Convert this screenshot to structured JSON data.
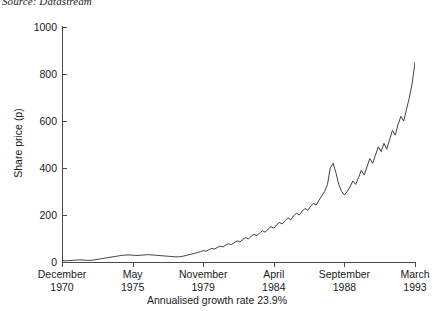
{
  "source_note": "Source: Datastream",
  "caption": "Annualised growth rate 23.9%",
  "chart_data": {
    "type": "line",
    "title": "",
    "subtitle": "",
    "source": "Source: Datastream",
    "annotation": "Annualised growth rate 23.9%",
    "xlabel": "",
    "ylabel": "Share price (p)",
    "ylim": [
      0,
      1000
    ],
    "yticks": [
      0,
      200,
      400,
      600,
      800,
      1000
    ],
    "ytick_labels": [
      "0",
      "200",
      "400",
      "600",
      "800",
      "1000"
    ],
    "grid": false,
    "legend": false,
    "legend_position": "none",
    "line_color": "#2b2b2b",
    "xtick_labels": [
      {
        "month": "December",
        "year": "1970"
      },
      {
        "month": "May",
        "year": "1975"
      },
      {
        "month": "November",
        "year": "1979"
      },
      {
        "month": "April",
        "year": "1984"
      },
      {
        "month": "September",
        "year": "1988"
      },
      {
        "month": "March",
        "year": "1993"
      }
    ],
    "xtick_positions_frac": [
      0.0,
      0.2,
      0.4,
      0.6,
      0.8,
      1.0
    ],
    "x_start": "December 1970",
    "x_end": "March 1993",
    "series": [
      {
        "name": "Share price (p)",
        "x_frac": [
          0.0,
          0.008,
          0.016,
          0.024,
          0.032,
          0.04,
          0.048,
          0.056,
          0.064,
          0.072,
          0.08,
          0.088,
          0.096,
          0.104,
          0.112,
          0.12,
          0.128,
          0.136,
          0.144,
          0.152,
          0.16,
          0.168,
          0.176,
          0.184,
          0.192,
          0.2,
          0.208,
          0.216,
          0.224,
          0.232,
          0.24,
          0.248,
          0.256,
          0.264,
          0.272,
          0.28,
          0.288,
          0.296,
          0.304,
          0.312,
          0.32,
          0.328,
          0.336,
          0.344,
          0.352,
          0.36,
          0.368,
          0.376,
          0.384,
          0.392,
          0.4,
          0.408,
          0.416,
          0.424,
          0.432,
          0.44,
          0.448,
          0.456,
          0.464,
          0.472,
          0.48,
          0.488,
          0.496,
          0.504,
          0.512,
          0.52,
          0.528,
          0.536,
          0.544,
          0.552,
          0.56,
          0.568,
          0.576,
          0.584,
          0.592,
          0.6,
          0.608,
          0.616,
          0.624,
          0.632,
          0.64,
          0.648,
          0.656,
          0.664,
          0.672,
          0.68,
          0.688,
          0.696,
          0.704,
          0.712,
          0.72,
          0.728,
          0.736,
          0.744,
          0.752,
          0.76,
          0.768,
          0.776,
          0.784,
          0.792,
          0.8,
          0.808,
          0.816,
          0.824,
          0.832,
          0.84,
          0.848,
          0.856,
          0.864,
          0.872,
          0.88,
          0.888,
          0.896,
          0.904,
          0.912,
          0.92,
          0.928,
          0.936,
          0.944,
          0.952,
          0.96,
          0.968,
          0.976,
          0.984,
          0.992,
          1.0
        ],
        "values": [
          5,
          5,
          6,
          6,
          7,
          8,
          9,
          9,
          8,
          7,
          7,
          8,
          10,
          12,
          14,
          16,
          18,
          20,
          22,
          24,
          26,
          28,
          29,
          30,
          30,
          29,
          28,
          28,
          29,
          30,
          31,
          31,
          30,
          29,
          28,
          27,
          26,
          25,
          24,
          23,
          22,
          22,
          23,
          25,
          28,
          31,
          34,
          37,
          40,
          44,
          48,
          46,
          52,
          58,
          55,
          62,
          68,
          64,
          72,
          78,
          74,
          82,
          90,
          86,
          95,
          104,
          98,
          110,
          118,
          112,
          124,
          133,
          127,
          140,
          150,
          144,
          158,
          168,
          162,
          176,
          188,
          180,
          196,
          208,
          200,
          215,
          228,
          220,
          236,
          250,
          242,
          262,
          282,
          300,
          330,
          400,
          420,
          380,
          330,
          300,
          285,
          300,
          320,
          345,
          330,
          360,
          390,
          370,
          405,
          440,
          420,
          455,
          490,
          470,
          505,
          480,
          520,
          560,
          540,
          585,
          620,
          600,
          650,
          700,
          760,
          850
        ]
      }
    ]
  }
}
